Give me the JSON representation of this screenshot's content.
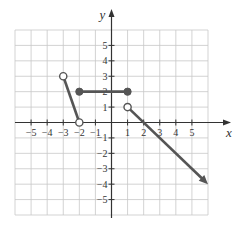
{
  "chart_data": {
    "type": "line",
    "title": "",
    "xlabel": "x",
    "ylabel": "y",
    "xlim": [
      -6,
      6
    ],
    "ylim": [
      -6,
      6
    ],
    "grid": true,
    "x_ticks": [
      "-5",
      "-4",
      "-3",
      "-2",
      "-1",
      "1",
      "2",
      "3",
      "4",
      "5"
    ],
    "y_ticks": [
      "5",
      "4",
      "3",
      "2",
      "1",
      "-1",
      "-2",
      "-3",
      "-4",
      "-5"
    ],
    "series": [
      {
        "name": "segment-1",
        "points": [
          [
            -3,
            3
          ],
          [
            -2,
            0
          ]
        ],
        "start": "open",
        "end": "open"
      },
      {
        "name": "segment-2",
        "points": [
          [
            -2,
            2
          ],
          [
            1,
            2
          ]
        ],
        "start": "closed",
        "end": "closed"
      },
      {
        "name": "ray-3",
        "points": [
          [
            1,
            1
          ],
          [
            6,
            -4
          ]
        ],
        "start": "open",
        "end": "arrow"
      }
    ],
    "color": "#555555"
  }
}
